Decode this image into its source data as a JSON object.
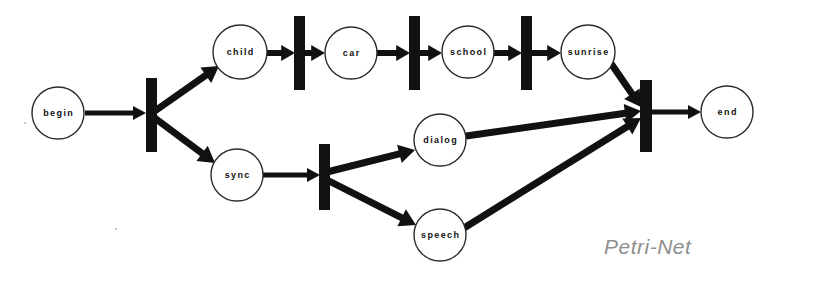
{
  "diagram": {
    "title": "Petri-Net",
    "caption": "Petri-Net",
    "caption_color": "#8e8e8e",
    "background_color": "#ffffff",
    "ink_color": "#111111",
    "places": [
      {
        "id": "begin",
        "label": "begin",
        "cx": 58,
        "cy": 113,
        "r": 26
      },
      {
        "id": "child",
        "label": "child",
        "cx": 240,
        "cy": 52,
        "r": 27
      },
      {
        "id": "car",
        "label": "car",
        "cx": 351,
        "cy": 53,
        "r": 26
      },
      {
        "id": "school",
        "label": "school",
        "cx": 468,
        "cy": 52,
        "r": 26
      },
      {
        "id": "sunrise",
        "label": "sunrise",
        "cx": 588,
        "cy": 52,
        "r": 27
      },
      {
        "id": "sync",
        "label": "sync",
        "cx": 237,
        "cy": 175,
        "r": 26
      },
      {
        "id": "dialog",
        "label": "dialog",
        "cx": 440,
        "cy": 140,
        "r": 26
      },
      {
        "id": "speech",
        "label": "speech",
        "cx": 440,
        "cy": 235,
        "r": 26
      },
      {
        "id": "end",
        "label": "end",
        "cx": 727,
        "cy": 112,
        "r": 26
      }
    ],
    "transitions": [
      {
        "id": "t-fork-begin",
        "x": 146,
        "y": 78,
        "w": 11,
        "h": 74
      },
      {
        "id": "t-child-car",
        "x": 294,
        "y": 16,
        "w": 11,
        "h": 74
      },
      {
        "id": "t-car-school",
        "x": 409,
        "y": 16,
        "w": 11,
        "h": 74
      },
      {
        "id": "t-school-sunrise",
        "x": 521,
        "y": 16,
        "w": 11,
        "h": 74
      },
      {
        "id": "t-fork-sync",
        "x": 319,
        "y": 144,
        "w": 11,
        "h": 66
      },
      {
        "id": "t-merge-end",
        "x": 640,
        "y": 80,
        "w": 12,
        "h": 72
      }
    ],
    "arcs": [
      {
        "id": "begin-to-fork",
        "from": "begin",
        "to": "t-fork-begin",
        "x1": 85,
        "y1": 113,
        "x2": 146,
        "y2": 113,
        "w": 5
      },
      {
        "id": "fork-to-child",
        "from": "t-fork-begin",
        "to": "child",
        "x1": 152,
        "y1": 113,
        "x2": 219,
        "y2": 66,
        "w": 7
      },
      {
        "id": "fork-to-sync",
        "from": "t-fork-begin",
        "to": "sync",
        "x1": 152,
        "y1": 116,
        "x2": 215,
        "y2": 163,
        "w": 7
      },
      {
        "id": "child-to-t1",
        "from": "child",
        "to": "t-child-car",
        "x1": 267,
        "y1": 53,
        "x2": 295,
        "y2": 53,
        "w": 6
      },
      {
        "id": "t1-to-car",
        "from": "t-child-car",
        "to": "car",
        "x1": 303,
        "y1": 53,
        "x2": 325,
        "y2": 53,
        "w": 6
      },
      {
        "id": "car-to-t2",
        "from": "car",
        "to": "t-car-school",
        "x1": 377,
        "y1": 53,
        "x2": 410,
        "y2": 53,
        "w": 6
      },
      {
        "id": "t2-to-school",
        "from": "t-car-school",
        "to": "school",
        "x1": 418,
        "y1": 53,
        "x2": 442,
        "y2": 53,
        "w": 6
      },
      {
        "id": "school-to-t3",
        "from": "school",
        "to": "t-school-sunrise",
        "x1": 494,
        "y1": 53,
        "x2": 522,
        "y2": 53,
        "w": 6
      },
      {
        "id": "t3-to-sunrise",
        "from": "t-school-sunrise",
        "to": "sunrise",
        "x1": 530,
        "y1": 53,
        "x2": 561,
        "y2": 53,
        "w": 6
      },
      {
        "id": "sunrise-to-merge",
        "from": "sunrise",
        "to": "t-merge-end",
        "x1": 610,
        "y1": 62,
        "x2": 641,
        "y2": 107,
        "w": 7
      },
      {
        "id": "sync-to-fork2",
        "from": "sync",
        "to": "t-fork-sync",
        "x1": 263,
        "y1": 175,
        "x2": 320,
        "y2": 175,
        "w": 5
      },
      {
        "id": "fork2-to-dialog",
        "from": "t-fork-sync",
        "to": "dialog",
        "x1": 327,
        "y1": 172,
        "x2": 415,
        "y2": 150,
        "w": 7
      },
      {
        "id": "fork2-to-speech",
        "from": "t-fork-sync",
        "to": "speech",
        "x1": 327,
        "y1": 180,
        "x2": 416,
        "y2": 225,
        "w": 7
      },
      {
        "id": "dialog-to-merge",
        "from": "dialog",
        "to": "t-merge-end",
        "x1": 466,
        "y1": 136,
        "x2": 641,
        "y2": 111,
        "w": 7
      },
      {
        "id": "speech-to-merge",
        "from": "speech",
        "to": "t-merge-end",
        "x1": 464,
        "y1": 228,
        "x2": 641,
        "y2": 118,
        "w": 7
      },
      {
        "id": "merge-to-end",
        "from": "t-merge-end",
        "to": "end",
        "x1": 651,
        "y1": 112,
        "x2": 701,
        "y2": 112,
        "w": 5
      }
    ],
    "caption_pos": {
      "x": 604,
      "y": 248
    }
  }
}
